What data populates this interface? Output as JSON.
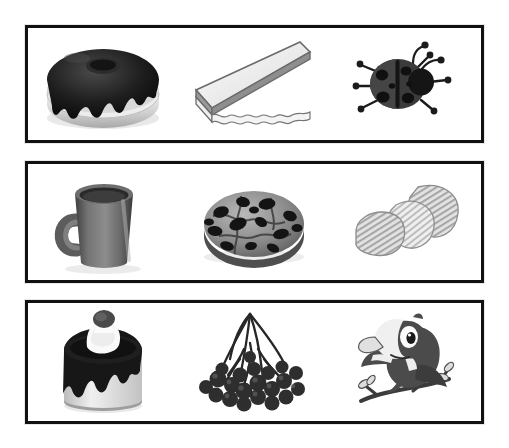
{
  "page": {
    "background_color": "#ffffff",
    "frame_border_color": "#111111",
    "frame_fill_color": "#ffffff",
    "rows_count": 3,
    "columns_count": 3
  },
  "palette": {
    "black": "#111111",
    "dark_gray": "#3a3a3a",
    "mid_gray": "#7d7d7d",
    "light_gray": "#c9c9c9",
    "pale_gray": "#e4e4e4",
    "white": "#ffffff"
  },
  "rows": [
    {
      "row_label": "Row 1",
      "frame": {
        "x": 25,
        "y": 25,
        "width": 459,
        "height": 118
      },
      "items": [
        {
          "name": "chocolate-donut",
          "label": "Chocolate frosted donut",
          "icon": "donut-icon",
          "category": "food",
          "tone": "dark"
        },
        {
          "name": "cake-slice",
          "label": "Triangular cake slice",
          "icon": "cake-slice-icon",
          "category": "food",
          "tone": "light"
        },
        {
          "name": "ladybug",
          "label": "Ladybug",
          "icon": "ladybug-icon",
          "category": "insect",
          "tone": "dark",
          "spots": 6,
          "legs": 6,
          "antennae": 2
        }
      ]
    },
    {
      "row_label": "Row 2",
      "frame": {
        "x": 25,
        "y": 161,
        "width": 459,
        "height": 122
      },
      "items": [
        {
          "name": "coffee-mug",
          "label": "Coffee mug",
          "icon": "mug-icon",
          "category": "tableware",
          "tone": "dark"
        },
        {
          "name": "chocolate-chip-cookie",
          "label": "Chocolate chip cookie",
          "icon": "cookie-icon",
          "category": "food",
          "tone": "mixed",
          "chips": 14
        },
        {
          "name": "potato-chips",
          "label": "Ridged potato chips",
          "icon": "potato-chips-icon",
          "category": "food",
          "tone": "light",
          "pieces": 3
        }
      ]
    },
    {
      "row_label": "Row 3",
      "frame": {
        "x": 25,
        "y": 300,
        "width": 459,
        "height": 124
      },
      "items": [
        {
          "name": "layer-cake",
          "label": "Cake with cream and berry",
          "icon": "cake-icon",
          "category": "food",
          "tone": "dark"
        },
        {
          "name": "berry-cluster",
          "label": "Cluster of dark berries",
          "icon": "berries-icon",
          "category": "fruit",
          "tone": "dark",
          "berries": 21
        },
        {
          "name": "cartoon-bird",
          "label": "Cartoon bird on branch",
          "icon": "bird-icon",
          "category": "animal",
          "tone": "dark"
        }
      ]
    }
  ]
}
